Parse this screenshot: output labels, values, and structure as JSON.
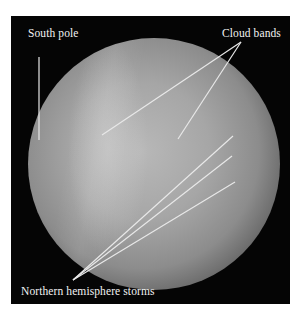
{
  "figure": {
    "labels": {
      "south_pole": "South pole",
      "cloud_bands": "Cloud bands",
      "northern_storms": "Northern hemisphere storms"
    },
    "colors": {
      "background": "#050505",
      "line": "#e8e8e8",
      "text": "#f2f2f2"
    }
  }
}
